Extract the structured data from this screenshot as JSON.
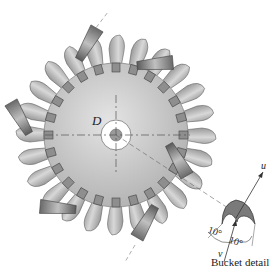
{
  "figure": {
    "type": "Pelton wheel schematic",
    "labels": {
      "diameter": "D",
      "bucket_speed": "u",
      "jet_speed": "v",
      "angle_left": "10°",
      "angle_right": "10°",
      "caption": "Bucket detail"
    },
    "wheel": {
      "buckets": 24,
      "nozzles": 6
    },
    "colors": {
      "disc": "#c8c8c8",
      "bucket": "#b5b5b5",
      "nozzle": "#8a8a8a",
      "line": "#555555",
      "bucket_dark": "#6e6e6e"
    }
  }
}
